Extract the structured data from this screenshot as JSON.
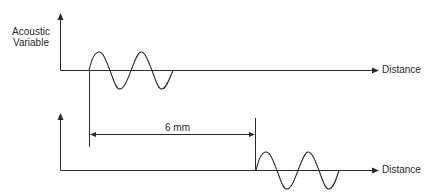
{
  "diagram": {
    "type": "waveform-propagation",
    "y_axis_label_line1": "Acoustic",
    "y_axis_label_line2": "Variable",
    "top_x_axis_label": "Distance",
    "bottom_x_axis_label": "Distance",
    "distance_label": "6 mm",
    "colors": {
      "stroke": "#2a2a2a",
      "background": "#ffffff"
    },
    "waves": [
      {
        "name": "top-wave",
        "start_x": 89,
        "baseline_y": 70,
        "cycles": 2,
        "period_px": 42,
        "amplitude_px": 18
      },
      {
        "name": "bottom-wave",
        "start_x": 255,
        "baseline_y": 170,
        "cycles": 2,
        "period_px": 41,
        "amplitude_px": 19
      }
    ]
  }
}
